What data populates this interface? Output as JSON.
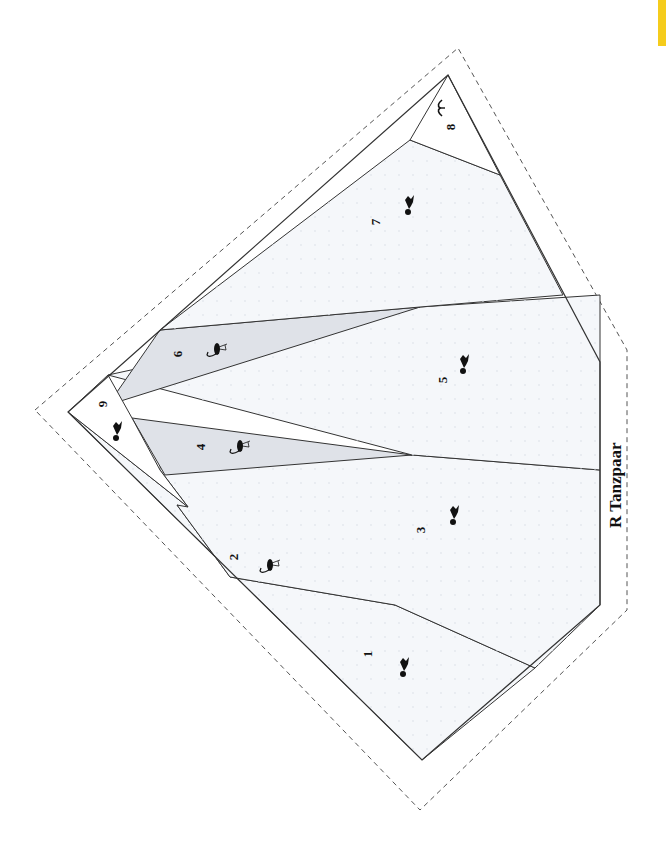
{
  "pattern": {
    "title": "R Tanzpaar",
    "title_position": {
      "x": 606,
      "y": 528
    },
    "colors": {
      "background": "#ffffff",
      "light_fabric": "#f5f7fa",
      "dark_fabric": "#dfe2e8",
      "outline": "#333333",
      "seam_dash": "#555555",
      "silhouette": "#111111",
      "tab": "#f5cc1c"
    },
    "seam_allowance_outline": [
      [
        35,
        410
      ],
      [
        458,
        48
      ],
      [
        627,
        350
      ],
      [
        627,
        610
      ],
      [
        420,
        810
      ]
    ],
    "outer_polygon": [
      [
        68,
        412
      ],
      [
        448,
        75
      ],
      [
        600,
        362
      ],
      [
        600,
        605
      ],
      [
        422,
        760
      ]
    ],
    "sections": [
      {
        "number": "1",
        "shade": "light",
        "polygon": [
          [
            68,
            412
          ],
          [
            188,
            507
          ],
          [
            395,
            605
          ],
          [
            535,
            668
          ],
          [
            422,
            760
          ]
        ],
        "label_pos": [
          372,
          654
        ],
        "figure": "dancer",
        "figure_pos": [
          405,
          668
        ]
      },
      {
        "number": "2",
        "shade": "dark",
        "polygon": [
          [
            177,
            505
          ],
          [
            395,
            605
          ],
          [
            230,
            577
          ]
        ],
        "label_pos": [
          238,
          557
        ],
        "figure": "flamingo",
        "figure_pos": [
          270,
          565
        ]
      },
      {
        "number": "3",
        "shade": "light",
        "polygon": [
          [
            160,
            470
          ],
          [
            188,
            507
          ],
          [
            177,
            505
          ],
          [
            230,
            577
          ],
          [
            395,
            605
          ],
          [
            535,
            668
          ],
          [
            600,
            605
          ],
          [
            600,
            470
          ],
          [
            412,
            455
          ],
          [
            163,
            437
          ]
        ],
        "label_pos": [
          425,
          530
        ],
        "figure": "dancer",
        "figure_pos": [
          455,
          516
        ]
      },
      {
        "number": "4",
        "shade": "dark",
        "polygon": [
          [
            132,
            418
          ],
          [
            412,
            455
          ],
          [
            165,
            475
          ]
        ],
        "label_pos": [
          205,
          447
        ],
        "figure": "flamingo",
        "figure_pos": [
          240,
          446
        ]
      },
      {
        "number": "5",
        "shade": "light",
        "polygon": [
          [
            108,
            375
          ],
          [
            412,
            455
          ],
          [
            600,
            470
          ],
          [
            600,
            295
          ],
          [
            420,
            307
          ]
        ],
        "label_pos": [
          447,
          380
        ],
        "figure": "dancer",
        "figure_pos": [
          465,
          365
        ]
      },
      {
        "number": "6",
        "shade": "dark",
        "polygon": [
          [
            160,
            330
          ],
          [
            420,
            307
          ],
          [
            108,
            405
          ]
        ],
        "label_pos": [
          182,
          354
        ],
        "figure": "flamingo",
        "figure_pos": [
          217,
          349
        ]
      },
      {
        "number": "7",
        "shade": "light",
        "polygon": [
          [
            160,
            330
          ],
          [
            410,
            140
          ],
          [
            500,
            175
          ],
          [
            563,
            295
          ],
          [
            420,
            307
          ]
        ],
        "label_pos": [
          380,
          222
        ],
        "figure": "dancer",
        "figure_pos": [
          410,
          206
        ]
      },
      {
        "number": "8",
        "shade": "white",
        "polygon": [
          [
            410,
            140
          ],
          [
            448,
            75
          ],
          [
            500,
            175
          ]
        ],
        "label_pos": [
          455,
          127
        ],
        "figure": "bird",
        "figure_pos": [
          440,
          108
        ]
      },
      {
        "number": "9",
        "shade": "white",
        "polygon": [
          [
            68,
            412
          ],
          [
            108,
            375
          ],
          [
            132,
            418
          ],
          [
            160,
            470
          ],
          [
            188,
            507
          ]
        ],
        "label_pos": [
          107,
          404
        ],
        "figure": "dancer",
        "figure_pos": [
          118,
          432
        ]
      }
    ]
  }
}
